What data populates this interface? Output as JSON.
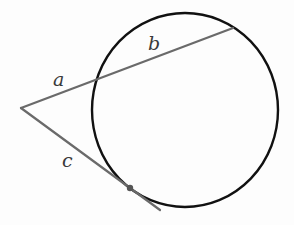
{
  "diagram": {
    "title": "",
    "labels": {
      "a": "a",
      "b": "b",
      "c": "c"
    },
    "colors": {
      "circle": "#111111",
      "segments": "#6a6a6a",
      "label": "#3a3a3a",
      "point": "#555555"
    },
    "circle": {
      "cx": 185,
      "cy": 110,
      "rx": 93,
      "ry": 97
    },
    "external_point": {
      "x": 21,
      "y": 108
    },
    "secant": {
      "from": [
        21,
        108
      ],
      "to": [
        233,
        28
      ],
      "entry": [
        96,
        80
      ]
    },
    "tangent": {
      "from": [
        21,
        108
      ],
      "to": [
        160,
        210
      ],
      "tangent_point": [
        130,
        188
      ]
    }
  }
}
